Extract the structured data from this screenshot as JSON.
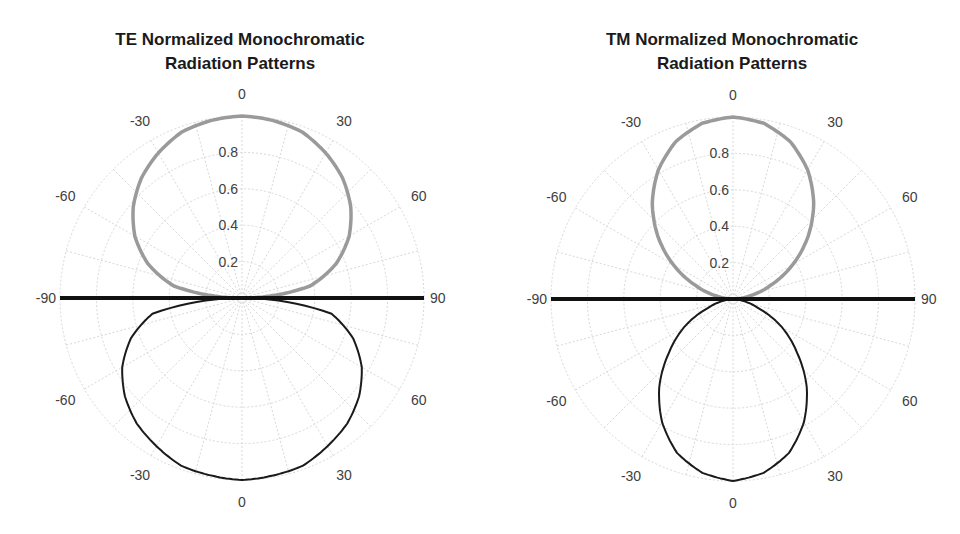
{
  "chart_data": [
    {
      "type": "polar",
      "title": "TE Normalized Monochromatic Radiation Patterns",
      "title_lines": [
        "TE Normalized Monochromatic",
        "Radiation Patterns"
      ],
      "radial_ticks": [
        "0.2",
        "0.4",
        "0.6",
        "0.8"
      ],
      "rlim": [
        0,
        1
      ],
      "angle_labels_upper": [
        {
          "angle": -90,
          "label": "-90"
        },
        {
          "angle": -60,
          "label": "-60"
        },
        {
          "angle": -30,
          "label": "-30"
        },
        {
          "angle": 0,
          "label": "0"
        },
        {
          "angle": 30,
          "label": "30"
        },
        {
          "angle": 60,
          "label": "60"
        },
        {
          "angle": 90,
          "label": "90"
        }
      ],
      "angle_labels_lower": [
        {
          "angle": -60,
          "label": "-60"
        },
        {
          "angle": -30,
          "label": "-30"
        },
        {
          "angle": 0,
          "label": "0"
        },
        {
          "angle": 30,
          "label": "30"
        },
        {
          "angle": 60,
          "label": "60"
        }
      ],
      "grid": true,
      "series": [
        {
          "name": "upper lobe",
          "color": "#9a9a9a",
          "width": 3.5,
          "hemisphere": "upper",
          "angles": [
            -90,
            -80,
            -70,
            -60,
            -50,
            -40,
            -30,
            -20,
            -10,
            0,
            10,
            20,
            30,
            40,
            50,
            60,
            70,
            80,
            90
          ],
          "values": [
            0.0,
            0.38,
            0.55,
            0.68,
            0.78,
            0.86,
            0.92,
            0.97,
            0.99,
            1.0,
            0.99,
            0.97,
            0.92,
            0.86,
            0.78,
            0.68,
            0.55,
            0.38,
            0.0
          ]
        },
        {
          "name": "lower lobe",
          "color": "#1a1a1a",
          "width": 2,
          "hemisphere": "lower",
          "angles": [
            -90,
            -80,
            -70,
            -60,
            -50,
            -40,
            -30,
            -20,
            -10,
            0,
            10,
            20,
            30,
            40,
            50,
            60,
            70,
            80,
            90
          ],
          "values": [
            0.0,
            0.5,
            0.65,
            0.76,
            0.84,
            0.9,
            0.94,
            0.98,
            0.99,
            1.0,
            0.99,
            0.98,
            0.94,
            0.9,
            0.84,
            0.76,
            0.65,
            0.5,
            0.0
          ]
        },
        {
          "name": "interface",
          "color": "#111111",
          "width": 4,
          "type": "horizontal-line",
          "from_angle": -90,
          "to_angle": 90,
          "value": 1.0
        }
      ]
    },
    {
      "type": "polar",
      "title": "TM Normalized Monochromatic Radiation Patterns",
      "title_lines": [
        "TM Normalized Monochromatic",
        "Radiation Patterns"
      ],
      "radial_ticks": [
        "0.2",
        "0.4",
        "0.6",
        "0.8"
      ],
      "rlim": [
        0,
        1
      ],
      "angle_labels_upper": [
        {
          "angle": -90,
          "label": "-90"
        },
        {
          "angle": -60,
          "label": "-60"
        },
        {
          "angle": -30,
          "label": "-30"
        },
        {
          "angle": 0,
          "label": "0"
        },
        {
          "angle": 30,
          "label": "30"
        },
        {
          "angle": 60,
          "label": "60"
        },
        {
          "angle": 90,
          "label": "90"
        }
      ],
      "angle_labels_lower": [
        {
          "angle": -60,
          "label": "-60"
        },
        {
          "angle": -30,
          "label": "-30"
        },
        {
          "angle": 0,
          "label": "0"
        },
        {
          "angle": 30,
          "label": "30"
        },
        {
          "angle": 60,
          "label": "60"
        }
      ],
      "grid": true,
      "series": [
        {
          "name": "upper lobe",
          "color": "#9a9a9a",
          "width": 3.5,
          "hemisphere": "upper",
          "angles": [
            -90,
            -80,
            -70,
            -60,
            -50,
            -40,
            -30,
            -20,
            -10,
            0,
            10,
            20,
            30,
            40,
            50,
            60,
            70,
            80,
            90
          ],
          "values": [
            0.0,
            0.09,
            0.22,
            0.38,
            0.54,
            0.69,
            0.82,
            0.92,
            0.98,
            1.0,
            0.98,
            0.92,
            0.82,
            0.69,
            0.54,
            0.38,
            0.22,
            0.09,
            0.0
          ]
        },
        {
          "name": "lower lobe",
          "color": "#1a1a1a",
          "width": 2,
          "hemisphere": "lower",
          "angles": [
            -90,
            -80,
            -70,
            -60,
            -50,
            -40,
            -30,
            -20,
            -10,
            0,
            10,
            20,
            30,
            40,
            50,
            60,
            70,
            80,
            90
          ],
          "values": [
            0.0,
            0.05,
            0.15,
            0.31,
            0.46,
            0.63,
            0.78,
            0.9,
            0.97,
            1.0,
            0.97,
            0.9,
            0.78,
            0.63,
            0.46,
            0.31,
            0.15,
            0.05,
            0.0
          ]
        },
        {
          "name": "interface",
          "color": "#111111",
          "width": 4,
          "type": "horizontal-line",
          "from_angle": -90,
          "to_angle": 90,
          "value": 1.0
        }
      ]
    }
  ],
  "layout": {
    "charts": [
      {
        "cx": 242,
        "cy": 298,
        "R": 182
      },
      {
        "cx": 733,
        "cy": 299,
        "R": 182
      }
    ],
    "grid_color": "#d8d8d8"
  }
}
